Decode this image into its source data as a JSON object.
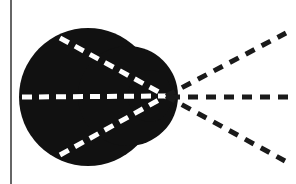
{
  "diagram": {
    "colors": {
      "background": "#ffffff",
      "shape_fill": "#111111",
      "inner_dash": "#ffffff",
      "outer_dash": "#1a1a1a",
      "frame_line": "#333333"
    },
    "focal_point": {
      "x": 166,
      "y": 96
    },
    "lines": [
      {
        "name": "upper-ray",
        "inner_start": {
          "x": 60,
          "y": 38
        },
        "outer_end": {
          "x": 286,
          "y": 33
        }
      },
      {
        "name": "middle-ray",
        "inner_start": {
          "x": 22,
          "y": 97
        },
        "outer_end": {
          "x": 296,
          "y": 97
        }
      },
      {
        "name": "lower-ray",
        "inner_start": {
          "x": 60,
          "y": 155
        },
        "outer_end": {
          "x": 285,
          "y": 161
        }
      }
    ]
  }
}
